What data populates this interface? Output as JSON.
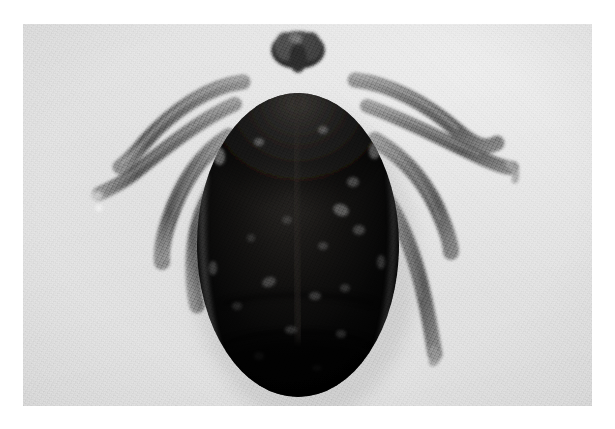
{
  "image": {
    "subject": "tick",
    "subject_label": "Engorged hard tick (Ixodidae), dorsal view",
    "medium": "black-and-white macro photograph",
    "orientation": "landscape",
    "canvas": {
      "width": 615,
      "height": 429
    },
    "border": {
      "color": "#ffffff",
      "left": 23,
      "top": 24,
      "right": 23,
      "bottom": 23
    },
    "plate": {
      "x": 23,
      "y": 24,
      "width": 569,
      "height": 382
    }
  },
  "colors": {
    "page_background": "#ffffff",
    "photo_background_light": "#efefef",
    "photo_background_mid": "#e6e6e6",
    "photo_background_dark": "#dcdcdc",
    "body_black": "#0a0a0a",
    "body_shadow": "#000000",
    "body_sheen": "#3a3a3a",
    "highlight_specular": "#d8d8d8",
    "leg_gray": "#6e6e6e",
    "leg_gray_light": "#9a9a9a",
    "leg_gray_dark": "#4a4a4a",
    "capitulum_gray": "#545454"
  },
  "subject_anatomy": {
    "body": {
      "name": "idiosoma",
      "shape": "ovoid",
      "center_x": 298,
      "center_y": 245,
      "radius_x": 101,
      "radius_y": 152,
      "tone": "near-black with glossy speckled highlights"
    },
    "capitulum": {
      "name": "capitulum-mouthparts",
      "x": 298,
      "y": 44,
      "width": 52,
      "height": 40,
      "tone": "dark gray, lobed"
    },
    "legs": [
      {
        "id": "leg-left-1",
        "side": "left",
        "tip_x": 96,
        "tip_y": 182
      },
      {
        "id": "leg-left-2",
        "side": "left",
        "tip_x": 120,
        "tip_y": 150
      },
      {
        "id": "leg-left-3",
        "side": "left",
        "tip_x": 163,
        "tip_y": 258
      },
      {
        "id": "leg-left-4",
        "side": "left",
        "tip_x": 196,
        "tip_y": 300
      },
      {
        "id": "leg-right-1",
        "side": "right",
        "tip_x": 512,
        "tip_y": 168
      },
      {
        "id": "leg-right-2",
        "side": "right",
        "tip_x": 497,
        "tip_y": 143
      },
      {
        "id": "leg-right-3",
        "side": "right",
        "tip_x": 455,
        "tip_y": 245
      },
      {
        "id": "leg-right-4",
        "side": "right",
        "tip_x": 437,
        "tip_y": 352
      }
    ],
    "leg_count": 8
  }
}
